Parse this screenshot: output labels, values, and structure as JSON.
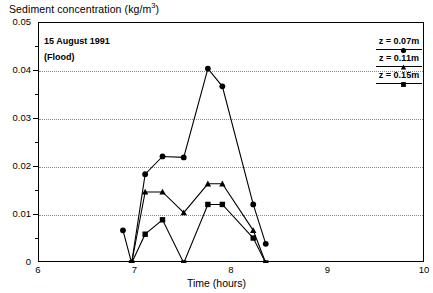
{
  "chart_data": {
    "type": "line",
    "title_main": "Sediment concentration (kg/m",
    "title_sup": "3",
    "title_tail": ")",
    "xlabel": "Time (hours)",
    "ylabel": "",
    "xlim": [
      6,
      10
    ],
    "ylim": [
      0,
      0.05
    ],
    "grid": true,
    "grid_axis": "y",
    "gridlines": [
      0.01,
      0.02,
      0.03,
      0.04
    ],
    "legend_position": "upper-right",
    "xticks": [
      6,
      7,
      8,
      9,
      10
    ],
    "xticklabels": [
      "6",
      "7",
      "8",
      "9",
      "10"
    ],
    "xticks_minor": [
      6.5,
      7.5,
      8.5,
      9.5
    ],
    "yticks": [
      0,
      0.01,
      0.02,
      0.03,
      0.04,
      0.05
    ],
    "yticklabels": [
      "0",
      "0.01",
      "0.02",
      "0.03",
      "0.04",
      "0.05"
    ],
    "yticks_minor": [
      0.005,
      0.015,
      0.025,
      0.035,
      0.045
    ],
    "annotations": [
      {
        "text": "15 August 1991",
        "x": 6.07,
        "y": 0.0465
      },
      {
        "text": "(Flood)",
        "x": 6.07,
        "y": 0.0432
      }
    ],
    "series": [
      {
        "name": "z = 0.07m",
        "marker": "circle",
        "color": "#000000",
        "x": [
          6.87,
          6.96,
          7.1,
          7.28,
          7.5,
          7.75,
          7.9,
          8.22,
          8.35
        ],
        "y": [
          0.0068,
          0.0,
          0.0185,
          0.0222,
          0.022,
          0.0405,
          0.0368,
          0.0122,
          0.004
        ]
      },
      {
        "name": "z = 0.11m",
        "marker": "triangle",
        "color": "#000000",
        "x": [
          6.96,
          7.1,
          7.28,
          7.5,
          7.75,
          7.9,
          8.22,
          8.35
        ],
        "y": [
          0.0,
          0.0148,
          0.0148,
          0.0105,
          0.0165,
          0.0165,
          0.0068,
          0.0
        ]
      },
      {
        "name": "z = 0.15m",
        "marker": "square",
        "color": "#000000",
        "x": [
          6.96,
          7.1,
          7.28,
          7.5,
          7.75,
          7.9,
          8.22,
          8.35
        ],
        "y": [
          0.0,
          0.006,
          0.009,
          0.0,
          0.0122,
          0.0122,
          0.0052,
          0.0
        ]
      }
    ]
  },
  "legend": [
    {
      "label": "z = 0.07m",
      "marker": "circle"
    },
    {
      "label": "z = 0.11m",
      "marker": "triangle"
    },
    {
      "label": "z = 0.15m",
      "marker": "square"
    }
  ]
}
